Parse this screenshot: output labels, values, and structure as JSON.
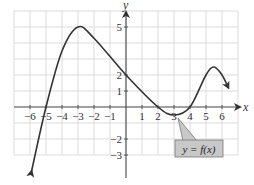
{
  "chart_data": {
    "type": "line",
    "title": "",
    "xlabel": "x",
    "ylabel": "y",
    "xlim": [
      -7,
      7
    ],
    "ylim": [
      -3,
      6
    ],
    "grid": true,
    "x_ticks": [
      -6,
      -5,
      -4,
      -3,
      -2,
      -1,
      1,
      2,
      3,
      4,
      5,
      6
    ],
    "y_ticks": [
      5,
      2,
      1,
      -2,
      -3
    ],
    "x_tick_labels": [
      "−6",
      "−5",
      "−4",
      "−3",
      "−2",
      "−1",
      "1",
      "2",
      "3",
      "4",
      "5",
      "6"
    ],
    "y_tick_labels": [
      "5",
      "2",
      "1",
      "−2",
      "−3"
    ],
    "series": [
      {
        "name": "y = f(x)",
        "points": [
          [
            -5.9,
            -4.0
          ],
          [
            -5.0,
            0.0
          ],
          [
            -4.0,
            3.5
          ],
          [
            -3.0,
            5.0
          ],
          [
            -2.0,
            4.3
          ],
          [
            0.0,
            2.0
          ],
          [
            2.0,
            0.0
          ],
          [
            3.0,
            -0.5
          ],
          [
            4.0,
            0.0
          ],
          [
            5.0,
            2.0
          ],
          [
            5.5,
            2.5
          ],
          [
            6.0,
            2.0
          ],
          [
            6.4,
            1.2
          ]
        ],
        "arrows": [
          "start",
          "end"
        ],
        "color": "#333333"
      }
    ],
    "annotations": [
      {
        "text": "y = f(x)",
        "points_to": [
          3.0,
          -0.5
        ],
        "box_color": "#c8c8c8"
      }
    ],
    "key_points": {
      "local_max": [
        -3,
        5
      ],
      "local_min": [
        3,
        -0.5
      ],
      "y_intercept": 2,
      "x_intercepts": [
        -5,
        2,
        4
      ]
    }
  },
  "labels": {
    "x_axis": "x",
    "y_axis": "y",
    "callout": "y = f(x)"
  }
}
